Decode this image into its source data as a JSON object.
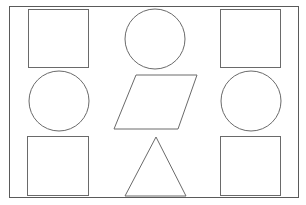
{
  "figure": {
    "layout": {
      "rows": 3,
      "cols": 3
    },
    "stroke_color": "#6a6a6a",
    "background": "#ffffff",
    "cells": [
      {
        "row": 1,
        "col": 1,
        "shape": "square"
      },
      {
        "row": 1,
        "col": 2,
        "shape": "circle"
      },
      {
        "row": 1,
        "col": 3,
        "shape": "square"
      },
      {
        "row": 2,
        "col": 1,
        "shape": "circle"
      },
      {
        "row": 2,
        "col": 2,
        "shape": "parallelogram"
      },
      {
        "row": 2,
        "col": 3,
        "shape": "circle"
      },
      {
        "row": 3,
        "col": 1,
        "shape": "square"
      },
      {
        "row": 3,
        "col": 2,
        "shape": "triangle"
      },
      {
        "row": 3,
        "col": 3,
        "shape": "square"
      }
    ]
  }
}
